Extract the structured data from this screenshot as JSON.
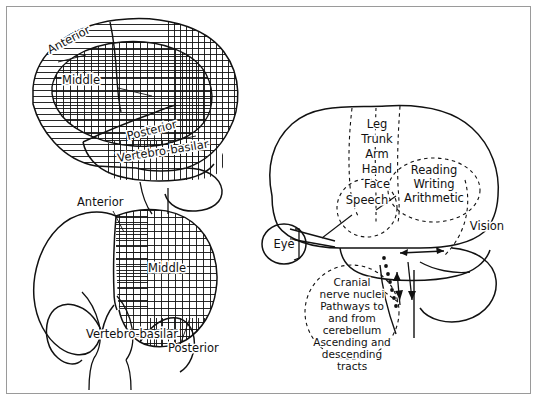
{
  "figure": {
    "background_color": "#ffffff",
    "line_color": "#111111",
    "frame_color": "#9a9a9a"
  },
  "panels": {
    "lateral_brain": {
      "name": "Lateral view of cerebral hemisphere - arterial territories",
      "labels": {
        "anterior": "Anterior",
        "middle": "Middle",
        "posterior": "Posterior",
        "vertebro_basilar": "Vertebro-basilar"
      },
      "hatch": {
        "anterior": "horizontal-lines",
        "middle": "cross-hatch-grid",
        "posterior": "vertical-lines"
      }
    },
    "coronal_brain": {
      "name": "Coronal section of brain - arterial territories",
      "labels": {
        "anterior": "Anterior",
        "middle": "Middle",
        "posterior": "Posterior",
        "vertebro_basilar": "Vertebro-basilar"
      },
      "hatch": {
        "anterior": "horizontal-lines",
        "middle": "cross-hatch-grid",
        "posterior": "vertical-lines"
      }
    },
    "function_brain": {
      "name": "Lateral view of brain - functional localization",
      "motor_strip": [
        "Leg",
        "Trunk",
        "Arm",
        "Hand",
        "Face"
      ],
      "speech": "Speech",
      "parietal": [
        "Reading",
        "Writing",
        "Arithmetic"
      ],
      "vision": "Vision",
      "eye": "Eye",
      "brainstem_callout": [
        "Cranial",
        "nerve nuclei",
        "Pathways to",
        "and from",
        "cerebellum",
        "Ascending and",
        "descending",
        "tracts"
      ]
    }
  }
}
